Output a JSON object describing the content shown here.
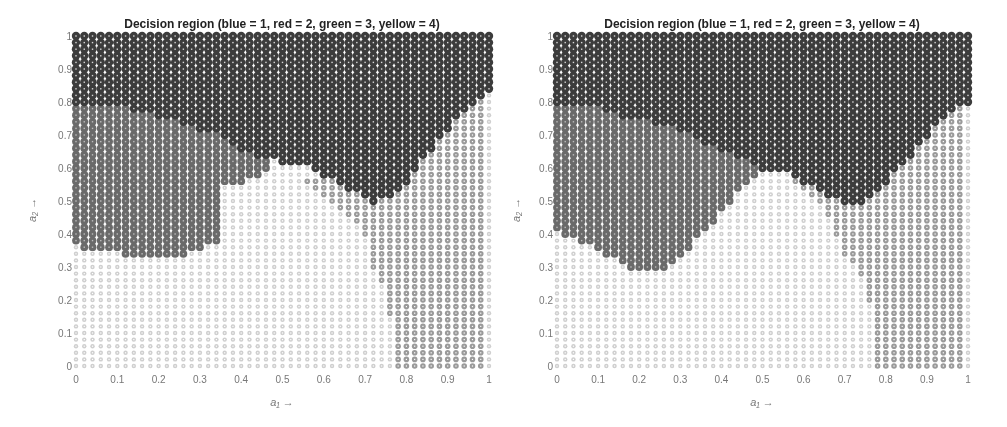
{
  "chart_data": [
    {
      "type": "scatter",
      "subtype": "decision-region-grid",
      "title": "Decision region (blue = 1, red = 2, green = 3, yellow = 4)",
      "xlabel": "a₁ →",
      "ylabel": "a₂ →",
      "xlim": [
        0,
        1
      ],
      "ylim": [
        0,
        1
      ],
      "xticks": [
        "0",
        "0.1",
        "0.2",
        "0.3",
        "0.4",
        "0.5",
        "0.6",
        "0.7",
        "0.8",
        "0.9",
        "1"
      ],
      "yticks": [
        "0",
        "0.1",
        "0.2",
        "0.3",
        "0.4",
        "0.5",
        "0.6",
        "0.7",
        "0.8",
        "0.9",
        "1"
      ],
      "grid_step": 0.02,
      "legend": [
        {
          "class": 1,
          "name": "blue",
          "color": "#3c3c3c"
        },
        {
          "class": 2,
          "name": "red",
          "color": "#6a6a6a"
        },
        {
          "class": 3,
          "name": "green",
          "color": "#cfcfcf"
        },
        {
          "class": 4,
          "name": "yellow",
          "color": "#9a9a9a"
        }
      ],
      "boundaries": {
        "class1_lower": [
          [
            0,
            0.8
          ],
          [
            0.1,
            0.79
          ],
          [
            0.2,
            0.76
          ],
          [
            0.3,
            0.72
          ],
          [
            0.35,
            0.7
          ],
          [
            0.4,
            0.66
          ],
          [
            0.45,
            0.63
          ],
          [
            0.5,
            0.62
          ],
          [
            0.55,
            0.61
          ],
          [
            0.6,
            0.58
          ],
          [
            0.65,
            0.54
          ],
          [
            0.7,
            0.51
          ],
          [
            0.72,
            0.5
          ],
          [
            0.75,
            0.51
          ],
          [
            0.8,
            0.56
          ],
          [
            0.85,
            0.64
          ],
          [
            0.9,
            0.72
          ],
          [
            0.95,
            0.78
          ],
          [
            1.0,
            0.84
          ]
        ],
        "class2_lower": [
          [
            0,
            0.37
          ],
          [
            0.02,
            0.35
          ],
          [
            0.1,
            0.35
          ],
          [
            0.12,
            0.33
          ],
          [
            0.25,
            0.33
          ],
          [
            0.3,
            0.35
          ],
          [
            0.34,
            0.38
          ],
          [
            0.35,
            0.56
          ],
          [
            0.4,
            0.56
          ],
          [
            0.45,
            0.57
          ],
          [
            0.46,
            0.6
          ]
        ],
        "class2_xmax": 0.46,
        "class4_region": [
          [
            0.55,
            0.56
          ],
          [
            0.6,
            0.52
          ],
          [
            0.65,
            0.46
          ],
          [
            0.7,
            0.4
          ],
          [
            0.72,
            0.3
          ],
          [
            0.75,
            0.22
          ],
          [
            0.77,
            0.1
          ],
          [
            0.78,
            0.0
          ],
          [
            1.0,
            0.0
          ],
          [
            1.0,
            0.84
          ]
        ]
      }
    },
    {
      "type": "scatter",
      "subtype": "decision-region-grid",
      "title": "Decision region (blue = 1, red = 2, green = 3, yellow = 4)",
      "xlabel": "a₁ →",
      "ylabel": "a₂ →",
      "xlim": [
        0,
        1
      ],
      "ylim": [
        0,
        1
      ],
      "xticks": [
        "0",
        "0.1",
        "0.2",
        "0.3",
        "0.4",
        "0.5",
        "0.6",
        "0.7",
        "0.8",
        "0.9",
        "1"
      ],
      "yticks": [
        "0",
        "0.1",
        "0.2",
        "0.3",
        "0.4",
        "0.5",
        "0.6",
        "0.7",
        "0.8",
        "0.9",
        "1"
      ],
      "grid_step": 0.02,
      "legend": [
        {
          "class": 1,
          "name": "blue",
          "color": "#3c3c3c"
        },
        {
          "class": 2,
          "name": "red",
          "color": "#6a6a6a"
        },
        {
          "class": 3,
          "name": "green",
          "color": "#cfcfcf"
        },
        {
          "class": 4,
          "name": "yellow",
          "color": "#9a9a9a"
        }
      ],
      "boundaries": {
        "class1_lower": [
          [
            0,
            0.8
          ],
          [
            0.1,
            0.79
          ],
          [
            0.15,
            0.76
          ],
          [
            0.3,
            0.72
          ],
          [
            0.35,
            0.68
          ],
          [
            0.45,
            0.63
          ],
          [
            0.5,
            0.59
          ],
          [
            0.55,
            0.6
          ],
          [
            0.6,
            0.56
          ],
          [
            0.65,
            0.52
          ],
          [
            0.7,
            0.5
          ],
          [
            0.75,
            0.5
          ],
          [
            0.8,
            0.56
          ],
          [
            0.85,
            0.62
          ],
          [
            0.9,
            0.7
          ],
          [
            0.95,
            0.76
          ],
          [
            1.0,
            0.8
          ]
        ],
        "class2_lower": [
          [
            0,
            0.41
          ],
          [
            0.02,
            0.4
          ],
          [
            0.06,
            0.38
          ],
          [
            0.1,
            0.36
          ],
          [
            0.12,
            0.34
          ],
          [
            0.16,
            0.32
          ],
          [
            0.18,
            0.3
          ],
          [
            0.26,
            0.3
          ],
          [
            0.28,
            0.32
          ],
          [
            0.32,
            0.36
          ],
          [
            0.36,
            0.41
          ],
          [
            0.4,
            0.47
          ],
          [
            0.44,
            0.53
          ],
          [
            0.46,
            0.56
          ],
          [
            0.5,
            0.59
          ]
        ],
        "class2_xmax": 0.5,
        "class4_region": [
          [
            0.55,
            0.57
          ],
          [
            0.62,
            0.52
          ],
          [
            0.66,
            0.46
          ],
          [
            0.68,
            0.4
          ],
          [
            0.7,
            0.34
          ],
          [
            0.74,
            0.28
          ],
          [
            0.76,
            0.2
          ],
          [
            0.77,
            0.1
          ],
          [
            0.78,
            0.0
          ],
          [
            1.0,
            0.0
          ],
          [
            1.0,
            0.8
          ]
        ]
      }
    }
  ],
  "panels": [
    {
      "left": 0,
      "x0": 76,
      "x1": 489,
      "y0": 366,
      "y1": 36
    },
    {
      "left": 0,
      "x0": 557,
      "x1": 968,
      "y0": 366,
      "y1": 36
    }
  ]
}
